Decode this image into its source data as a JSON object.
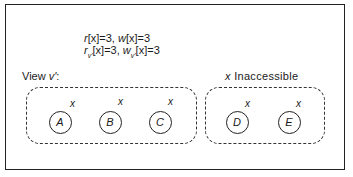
{
  "equations": {
    "line1": {
      "r_label": "r",
      "r_arg": "[x]=3,",
      "w_label": "w",
      "w_arg": "[x]=3"
    },
    "line2": {
      "r_label": "r",
      "r_sub": "v'",
      "r_arg": "[x]=3,",
      "w_label": "w",
      "w_sub": "v'",
      "w_arg": "[x]=3"
    }
  },
  "view_label": {
    "prefix": "View ",
    "name": "v'",
    "suffix": ":"
  },
  "inaccessible_label": {
    "var": "x",
    "text": " Inaccessible"
  },
  "groups": [
    {
      "name": "view-group",
      "nodes": [
        {
          "label": "A",
          "var": "x",
          "cx": 60,
          "cy": 122
        },
        {
          "label": "B",
          "var": "x",
          "cx": 110,
          "cy": 122
        },
        {
          "label": "C",
          "var": "x",
          "cx": 160,
          "cy": 122
        }
      ]
    },
    {
      "name": "inaccessible-group",
      "nodes": [
        {
          "label": "D",
          "var": "x",
          "cx": 237,
          "cy": 122
        },
        {
          "label": "E",
          "var": "x",
          "cx": 289,
          "cy": 122
        }
      ]
    }
  ]
}
